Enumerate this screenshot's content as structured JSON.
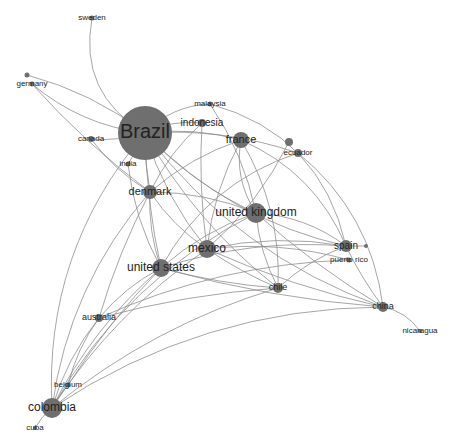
{
  "diagram": {
    "type": "network-graph",
    "colors": {
      "node": "#6f6f6f",
      "edge": "#8a8a8a",
      "label": "#222222",
      "background": "#ffffff"
    },
    "nodes": [
      {
        "id": "sweden",
        "label": "sweden",
        "x": 92,
        "y": 18,
        "r": 2.5,
        "fs": 8
      },
      {
        "id": "germany_dot",
        "label": "",
        "x": 27,
        "y": 75,
        "r": 2.5,
        "fs": 8
      },
      {
        "id": "germany",
        "label": "germany",
        "x": 32,
        "y": 84,
        "r": 2.5,
        "fs": 8
      },
      {
        "id": "brazil",
        "label": "Brazil",
        "x": 145,
        "y": 133,
        "r": 27,
        "fs": 20
      },
      {
        "id": "canada",
        "label": "canada",
        "x": 91,
        "y": 139,
        "r": 3,
        "fs": 8
      },
      {
        "id": "india",
        "label": "india",
        "x": 128,
        "y": 164,
        "r": 2.5,
        "fs": 8
      },
      {
        "id": "malaysia",
        "label": "malaysia",
        "x": 210,
        "y": 104,
        "r": 2.5,
        "fs": 8
      },
      {
        "id": "indonesia",
        "label": "indonesia",
        "x": 202,
        "y": 123,
        "r": 4,
        "fs": 10
      },
      {
        "id": "france",
        "label": "france",
        "x": 241,
        "y": 140,
        "r": 8,
        "fs": 11
      },
      {
        "id": "ecuador_dot",
        "label": "",
        "x": 289,
        "y": 142,
        "r": 4,
        "fs": 8
      },
      {
        "id": "ecuador",
        "label": "ecuador",
        "x": 298,
        "y": 153,
        "r": 4,
        "fs": 8
      },
      {
        "id": "denmark",
        "label": "denmark",
        "x": 150,
        "y": 192,
        "r": 7,
        "fs": 11
      },
      {
        "id": "united_kingdom",
        "label": "united kingdom",
        "x": 256,
        "y": 213,
        "r": 10,
        "fs": 12
      },
      {
        "id": "mexico",
        "label": "mexico",
        "x": 207,
        "y": 249,
        "r": 9,
        "fs": 12
      },
      {
        "id": "united_states",
        "label": "united states",
        "x": 161,
        "y": 268,
        "r": 9,
        "fs": 12
      },
      {
        "id": "spain",
        "label": "spain",
        "x": 346,
        "y": 246,
        "r": 6,
        "fs": 10
      },
      {
        "id": "spain_dot",
        "label": "",
        "x": 366,
        "y": 246,
        "r": 2,
        "fs": 8
      },
      {
        "id": "puerto_rico",
        "label": "puerto rico",
        "x": 349,
        "y": 260,
        "r": 2.5,
        "fs": 8
      },
      {
        "id": "chile",
        "label": "chile",
        "x": 278,
        "y": 288,
        "r": 5,
        "fs": 9
      },
      {
        "id": "china",
        "label": "china",
        "x": 383,
        "y": 307,
        "r": 5,
        "fs": 9
      },
      {
        "id": "nicaragua",
        "label": "nicaragua",
        "x": 420,
        "y": 331,
        "r": 2,
        "fs": 8
      },
      {
        "id": "australia",
        "label": "australia",
        "x": 99,
        "y": 318,
        "r": 4,
        "fs": 9
      },
      {
        "id": "belgium",
        "label": "belgium",
        "x": 68,
        "y": 385,
        "r": 2.5,
        "fs": 8
      },
      {
        "id": "colombia",
        "label": "colombia",
        "x": 52,
        "y": 408,
        "r": 10,
        "fs": 12
      },
      {
        "id": "cuba",
        "label": "cuba",
        "x": 35,
        "y": 428,
        "r": 2,
        "fs": 8
      }
    ],
    "edges": [
      [
        "sweden",
        "brazil",
        0.35
      ],
      [
        "germany",
        "brazil",
        0.15
      ],
      [
        "germany_dot",
        "brazil",
        -0.1
      ],
      [
        "germany",
        "denmark",
        0.05
      ],
      [
        "canada",
        "brazil",
        0.1
      ],
      [
        "canada",
        "denmark",
        0.1
      ],
      [
        "india",
        "brazil",
        0.05
      ],
      [
        "india",
        "united_states",
        0.1
      ],
      [
        "brazil",
        "malaysia",
        -0.2
      ],
      [
        "brazil",
        "indonesia",
        -0.15
      ],
      [
        "brazil",
        "france",
        -0.1
      ],
      [
        "brazil",
        "ecuador",
        -0.1
      ],
      [
        "brazil",
        "united_kingdom",
        0.1
      ],
      [
        "brazil",
        "mexico",
        0.1
      ],
      [
        "brazil",
        "united_states",
        0.05
      ],
      [
        "brazil",
        "spain",
        0.15
      ],
      [
        "brazil",
        "chile",
        0.1
      ],
      [
        "brazil",
        "china",
        0.15
      ],
      [
        "brazil",
        "colombia",
        0.2
      ],
      [
        "brazil",
        "denmark",
        0.05
      ],
      [
        "malaysia",
        "united_kingdom",
        -0.1
      ],
      [
        "malaysia",
        "spain",
        -0.3
      ],
      [
        "indonesia",
        "mexico",
        0.05
      ],
      [
        "indonesia",
        "denmark",
        0.1
      ],
      [
        "france",
        "united_kingdom",
        0.2
      ],
      [
        "france",
        "mexico",
        0.1
      ],
      [
        "france",
        "chile",
        -0.15
      ],
      [
        "france",
        "denmark",
        0.1
      ],
      [
        "france",
        "spain",
        -0.2
      ],
      [
        "ecuador_dot",
        "mexico",
        -0.1
      ],
      [
        "ecuador",
        "china",
        -0.2
      ],
      [
        "ecuador",
        "united_states",
        0.2
      ],
      [
        "denmark",
        "united_kingdom",
        -0.1
      ],
      [
        "denmark",
        "mexico",
        0.1
      ],
      [
        "denmark",
        "united_states",
        0.1
      ],
      [
        "united_kingdom",
        "spain",
        -0.15
      ],
      [
        "united_kingdom",
        "chile",
        0.1
      ],
      [
        "united_kingdom",
        "china",
        0.05
      ],
      [
        "united_kingdom",
        "united_states",
        0.1
      ],
      [
        "united_kingdom",
        "colombia",
        0.15
      ],
      [
        "mexico",
        "spain",
        -0.1
      ],
      [
        "mexico",
        "chile",
        0.05
      ],
      [
        "mexico",
        "china",
        0.05
      ],
      [
        "mexico",
        "puerto_rico",
        -0.1
      ],
      [
        "mexico",
        "colombia",
        0.1
      ],
      [
        "united_states",
        "spain",
        -0.1
      ],
      [
        "united_states",
        "chile",
        0.05
      ],
      [
        "united_states",
        "china",
        0.05
      ],
      [
        "united_states",
        "australia",
        0.1
      ],
      [
        "united_states",
        "colombia",
        0.1
      ],
      [
        "united_states",
        "belgium",
        0.05
      ],
      [
        "spain",
        "spain_dot",
        0
      ],
      [
        "spain",
        "china",
        0.05
      ],
      [
        "spain",
        "chile",
        0.1
      ],
      [
        "puerto_rico",
        "australia",
        0.1
      ],
      [
        "china",
        "nicaragua",
        -0.2
      ],
      [
        "chile",
        "colombia",
        0.1
      ],
      [
        "china",
        "colombia",
        0.15
      ],
      [
        "chile",
        "australia",
        0.05
      ],
      [
        "australia",
        "colombia",
        0.1
      ],
      [
        "australia",
        "belgium",
        0.1
      ],
      [
        "belgium",
        "colombia",
        0.05
      ],
      [
        "colombia",
        "cuba",
        0.1
      ],
      [
        "denmark",
        "colombia",
        0.15
      ],
      [
        "denmark",
        "australia",
        0.05
      ]
    ]
  }
}
